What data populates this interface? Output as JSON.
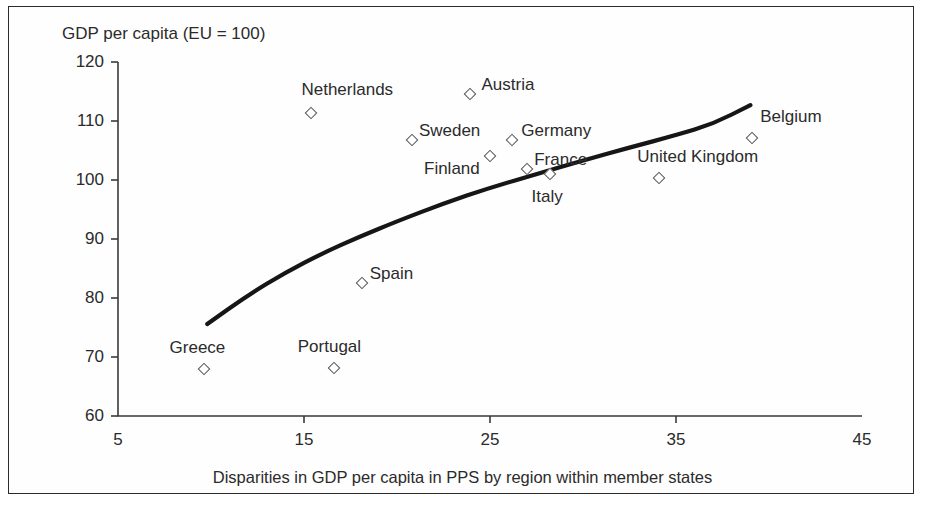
{
  "chart_data": {
    "type": "scatter",
    "title": "",
    "ylabel": "GDP per capita (EU = 100)",
    "xlabel": "Disparities in GDP per capita in PPS by region within member states",
    "xlim": [
      5,
      45
    ],
    "ylim": [
      60,
      120
    ],
    "xticks": [
      5,
      15,
      25,
      35,
      45
    ],
    "yticks": [
      60,
      70,
      80,
      90,
      100,
      110,
      120
    ],
    "grid": false,
    "legend": "none",
    "marker_style": "open-diamond",
    "points": [
      {
        "name": "Greece",
        "x": 9.6,
        "y": 67.9,
        "label_dx": -34,
        "label_dy": -22
      },
      {
        "name": "Portugal",
        "x": 16.6,
        "y": 68.2,
        "label_dx": -36,
        "label_dy": -22
      },
      {
        "name": "Spain",
        "x": 18.1,
        "y": 82.6,
        "label_dx": 8,
        "label_dy": -10
      },
      {
        "name": "Netherlands",
        "x": 15.4,
        "y": 111.4,
        "label_dx": -10,
        "label_dy": -24
      },
      {
        "name": "Austria",
        "x": 23.9,
        "y": 114.5,
        "label_dx": 12,
        "label_dy": -10
      },
      {
        "name": "Sweden",
        "x": 20.8,
        "y": 106.7,
        "label_dx": 7,
        "label_dy": -10
      },
      {
        "name": "Finland",
        "x": 25.0,
        "y": 104.0,
        "label_dx": -66,
        "label_dy": 12
      },
      {
        "name": "Germany",
        "x": 26.2,
        "y": 106.7,
        "label_dx": 9,
        "label_dy": -10
      },
      {
        "name": "France",
        "x": 27.0,
        "y": 101.9,
        "label_dx": 7,
        "label_dy": -10
      },
      {
        "name": "Italy",
        "x": 28.2,
        "y": 101.0,
        "label_dx": -18,
        "label_dy": 22
      },
      {
        "name": "United Kingdom",
        "x": 34.1,
        "y": 100.4,
        "label_dx": -22,
        "label_dy": -22
      },
      {
        "name": "Belgium",
        "x": 39.1,
        "y": 107.1,
        "label_dx": 8,
        "label_dy": -22
      }
    ],
    "trend_curve": {
      "description": "fitted logarithmic trend line",
      "points": [
        {
          "x": 9.8,
          "y": 75.6
        },
        {
          "x": 12.0,
          "y": 80.5
        },
        {
          "x": 14.0,
          "y": 84.3
        },
        {
          "x": 16.0,
          "y": 87.6
        },
        {
          "x": 18.0,
          "y": 90.4
        },
        {
          "x": 20.0,
          "y": 93.0
        },
        {
          "x": 22.5,
          "y": 96.0
        },
        {
          "x": 25.0,
          "y": 98.7
        },
        {
          "x": 27.5,
          "y": 101.0
        },
        {
          "x": 30.0,
          "y": 103.3
        },
        {
          "x": 32.5,
          "y": 105.5
        },
        {
          "x": 35.0,
          "y": 107.6
        },
        {
          "x": 37.0,
          "y": 109.5
        },
        {
          "x": 39.0,
          "y": 112.7
        }
      ]
    }
  }
}
